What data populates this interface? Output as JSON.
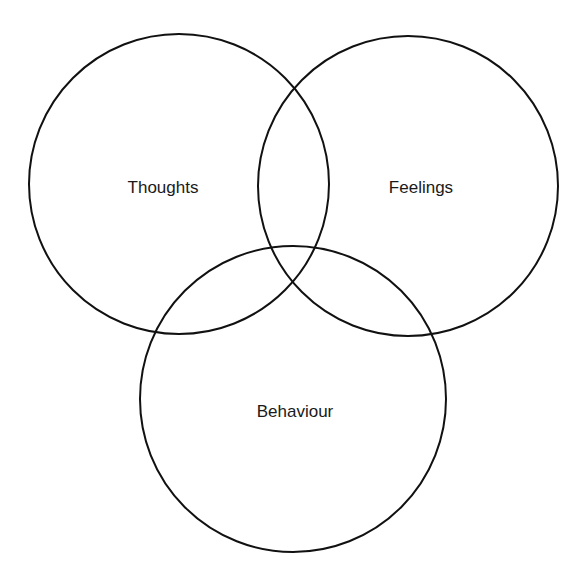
{
  "diagram": {
    "type": "venn",
    "sets": [
      {
        "id": "thoughts",
        "label": "Thoughts",
        "cx": 179,
        "cy": 184,
        "r": 150,
        "label_x": 163,
        "label_y": 193
      },
      {
        "id": "feelings",
        "label": "Feelings",
        "cx": 408,
        "cy": 186,
        "r": 150,
        "label_x": 421,
        "label_y": 193
      },
      {
        "id": "behaviour",
        "label": "Behaviour",
        "cx": 293,
        "cy": 399,
        "r": 153,
        "label_x": 295,
        "label_y": 417
      }
    ],
    "stroke_color": "#111111",
    "background_color": "#ffffff"
  }
}
